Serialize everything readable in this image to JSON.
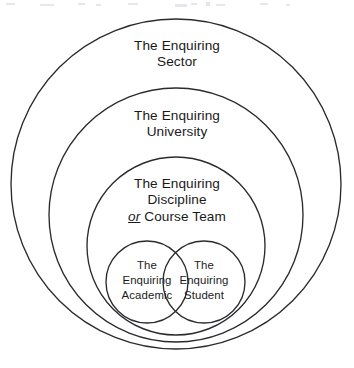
{
  "diagram": {
    "type": "nested-venn",
    "background_color": "#ffffff",
    "stroke_color": "#2b2b2f",
    "rings": [
      {
        "id": "sector",
        "lines": [
          "The Enquiring",
          "Sector"
        ],
        "cx": 176,
        "cy": 184,
        "r": 165
      },
      {
        "id": "university",
        "lines": [
          "The Enquiring",
          "University"
        ],
        "cx": 176,
        "cy": 215,
        "r": 127
      },
      {
        "id": "discipline",
        "lines": [
          "The Enquiring",
          "Discipline"
        ],
        "emphasis_word": "or",
        "trailing_text": " Course Team",
        "cx": 176,
        "cy": 246,
        "r": 89
      }
    ],
    "venn": [
      {
        "id": "academic",
        "lines": [
          "The",
          "Enquiring",
          "Academic"
        ],
        "cx": 147,
        "cy": 282,
        "r": 41
      },
      {
        "id": "student",
        "lines": [
          "The",
          "Enquiring",
          "Student"
        ],
        "cx": 204,
        "cy": 282,
        "r": 41
      }
    ]
  }
}
